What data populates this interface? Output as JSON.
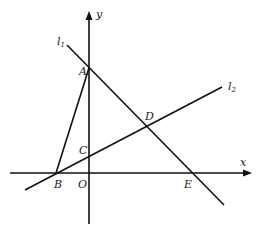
{
  "diagram": {
    "axes": {
      "x_label": "x",
      "y_label": "y",
      "origin_label": "O"
    },
    "lines": [
      {
        "name": "l",
        "subscript": "1"
      },
      {
        "name": "l",
        "subscript": "2"
      }
    ],
    "points": {
      "A": "A",
      "B": "B",
      "C": "C",
      "D": "D",
      "E": "E"
    },
    "colors": {
      "stroke": "#111111",
      "background": "#ffffff"
    }
  }
}
